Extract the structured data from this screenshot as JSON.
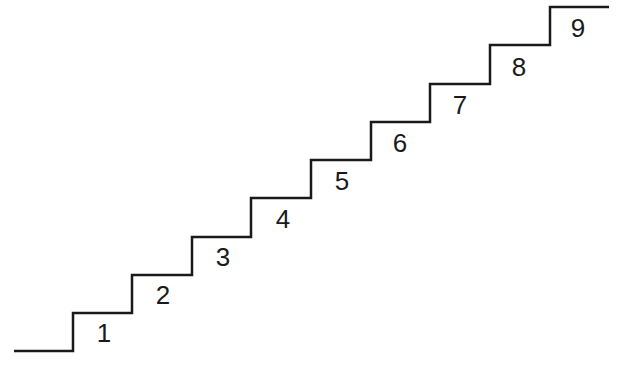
{
  "diagram": {
    "type": "staircase",
    "stroke_color": "#1a1a1a",
    "stroke_width": 2.5,
    "points": [
      [
        14,
        351
      ],
      [
        73,
        351
      ],
      [
        73,
        313
      ],
      [
        132,
        313
      ],
      [
        132,
        275
      ],
      [
        192,
        275
      ],
      [
        192,
        237
      ],
      [
        251,
        237
      ],
      [
        251,
        198
      ],
      [
        311,
        198
      ],
      [
        311,
        160
      ],
      [
        371,
        160
      ],
      [
        371,
        122
      ],
      [
        430,
        122
      ],
      [
        430,
        84
      ],
      [
        490,
        84
      ],
      [
        490,
        45
      ],
      [
        550,
        45
      ],
      [
        550,
        7
      ],
      [
        609,
        7
      ]
    ],
    "steps": [
      {
        "label": "1",
        "x": 104,
        "y": 333
      },
      {
        "label": "2",
        "x": 163,
        "y": 295
      },
      {
        "label": "3",
        "x": 223,
        "y": 257
      },
      {
        "label": "4",
        "x": 283,
        "y": 219
      },
      {
        "label": "5",
        "x": 342,
        "y": 181
      },
      {
        "label": "6",
        "x": 400,
        "y": 143
      },
      {
        "label": "7",
        "x": 460,
        "y": 105
      },
      {
        "label": "8",
        "x": 519,
        "y": 67
      },
      {
        "label": "9",
        "x": 578,
        "y": 28
      }
    ]
  }
}
